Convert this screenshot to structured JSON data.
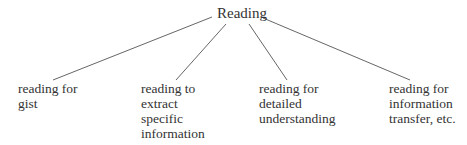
{
  "diagram": {
    "type": "tree",
    "root": {
      "label": "Reading"
    },
    "children": [
      {
        "lines": [
          "reading for",
          "gist"
        ]
      },
      {
        "lines": [
          "reading to",
          "extract",
          "specific",
          "information"
        ]
      },
      {
        "lines": [
          "reading for",
          "detailed",
          "understanding"
        ]
      },
      {
        "lines": [
          "reading for",
          "information",
          "transfer, etc."
        ]
      }
    ]
  }
}
